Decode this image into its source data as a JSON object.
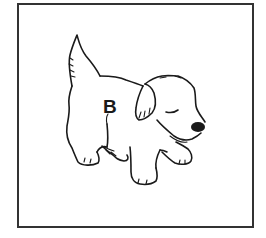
{
  "card": {
    "label": "B",
    "subject": "puppy",
    "border_color": "#333333",
    "ink_color": "#1a1a1a"
  }
}
